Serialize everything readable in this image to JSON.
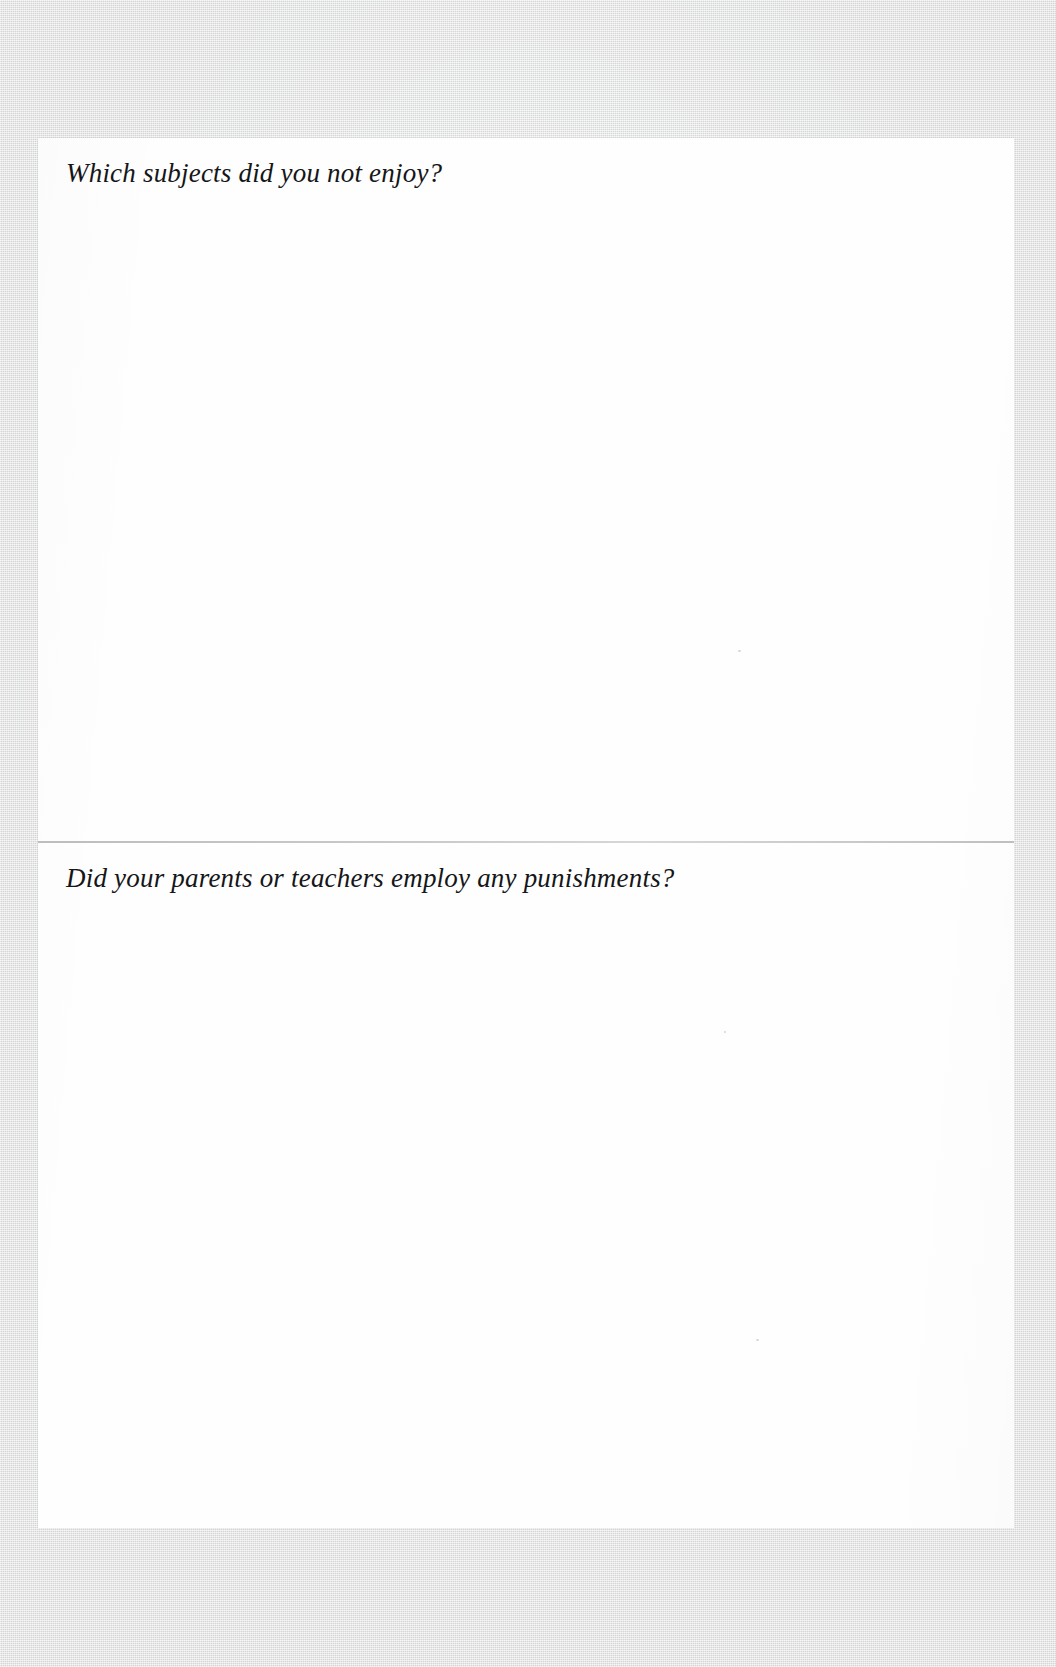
{
  "document": {
    "type": "scanned-questionnaire-page",
    "background_color": "#d9dadb",
    "page_color": "#fefefe",
    "text_color": "#151618",
    "divider_color": "#b8babd"
  },
  "questions": [
    {
      "id": "q1",
      "prompt": "Which subjects did you not enjoy?",
      "answer": ""
    },
    {
      "id": "q2",
      "prompt": "Did your parents or teachers employ any punishments?",
      "answer": ""
    }
  ]
}
